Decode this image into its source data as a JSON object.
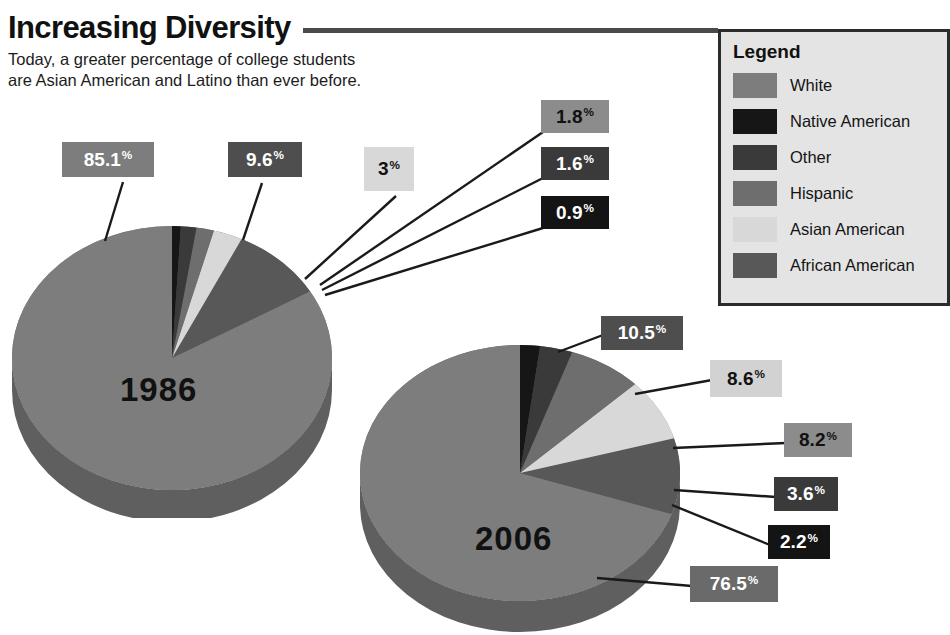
{
  "header": {
    "title": "Increasing Diversity",
    "subtitle": "Today, a greater percentage of college students\nare Asian American and Latino than ever before."
  },
  "legend": {
    "title": "Legend",
    "items": [
      {
        "label": "White",
        "color": "#7d7d7d"
      },
      {
        "label": "Native American",
        "color": "#161616"
      },
      {
        "label": "Other",
        "color": "#3a3a3a"
      },
      {
        "label": "Hispanic",
        "color": "#6e6e6e"
      },
      {
        "label": "Asian American",
        "color": "#d8d8d8"
      },
      {
        "label": "African American",
        "color": "#585858"
      }
    ]
  },
  "charts": {
    "chart_1986": {
      "year": "1986"
    },
    "chart_2006": {
      "year": "2006"
    }
  },
  "callouts_1986": [
    {
      "value": "85.1",
      "suffix": "%",
      "bg": "#7d7d7d",
      "fg": "#ffffff"
    },
    {
      "value": "9.6",
      "suffix": "%",
      "bg": "#4e4e4e",
      "fg": "#ffffff"
    },
    {
      "value": "3",
      "suffix": "%",
      "bg": "#d8d8d8",
      "fg": "#111111"
    },
    {
      "value": "1.8",
      "suffix": "%",
      "bg": "#8c8c8c",
      "fg": "#111111"
    },
    {
      "value": "1.6",
      "suffix": "%",
      "bg": "#3a3a3a",
      "fg": "#ffffff"
    },
    {
      "value": "0.9",
      "suffix": "%",
      "bg": "#141414",
      "fg": "#ffffff"
    }
  ],
  "callouts_2006": [
    {
      "value": "10.5",
      "suffix": "%",
      "bg": "#4e4e4e",
      "fg": "#ffffff"
    },
    {
      "value": "8.6",
      "suffix": "%",
      "bg": "#d2d2d2",
      "fg": "#111111"
    },
    {
      "value": "8.2",
      "suffix": "%",
      "bg": "#8c8c8c",
      "fg": "#111111"
    },
    {
      "value": "3.6",
      "suffix": "%",
      "bg": "#3a3a3a",
      "fg": "#ffffff"
    },
    {
      "value": "2.2",
      "suffix": "%",
      "bg": "#141414",
      "fg": "#ffffff"
    },
    {
      "value": "76.5",
      "suffix": "%",
      "bg": "#6a6a6a",
      "fg": "#ffffff"
    }
  ],
  "chart_data": [
    {
      "type": "pie",
      "title": "1986",
      "categories": [
        "White",
        "African American",
        "Asian American",
        "Hispanic",
        "Other",
        "Native American"
      ],
      "values": [
        85.1,
        9.6,
        3,
        1.8,
        1.6,
        0.9
      ],
      "labels": [
        "85.1%",
        "9.6%",
        "3%",
        "1.8%",
        "1.6%",
        "0.9%"
      ],
      "colors": [
        "#7d7d7d",
        "#585858",
        "#d8d8d8",
        "#6e6e6e",
        "#3a3a3a",
        "#161616"
      ],
      "legend_position": "right",
      "units": "percent"
    },
    {
      "type": "pie",
      "title": "2006",
      "categories": [
        "White",
        "African American",
        "Asian American",
        "Hispanic",
        "Other",
        "Native American"
      ],
      "values": [
        76.5,
        10.5,
        8.6,
        8.2,
        3.6,
        2.2
      ],
      "labels": [
        "76.5%",
        "10.5%",
        "8.6%",
        "8.2%",
        "3.6%",
        "2.2%"
      ],
      "colors": [
        "#7d7d7d",
        "#585858",
        "#d8d8d8",
        "#6e6e6e",
        "#3a3a3a",
        "#161616"
      ],
      "legend_position": "right",
      "units": "percent"
    }
  ]
}
